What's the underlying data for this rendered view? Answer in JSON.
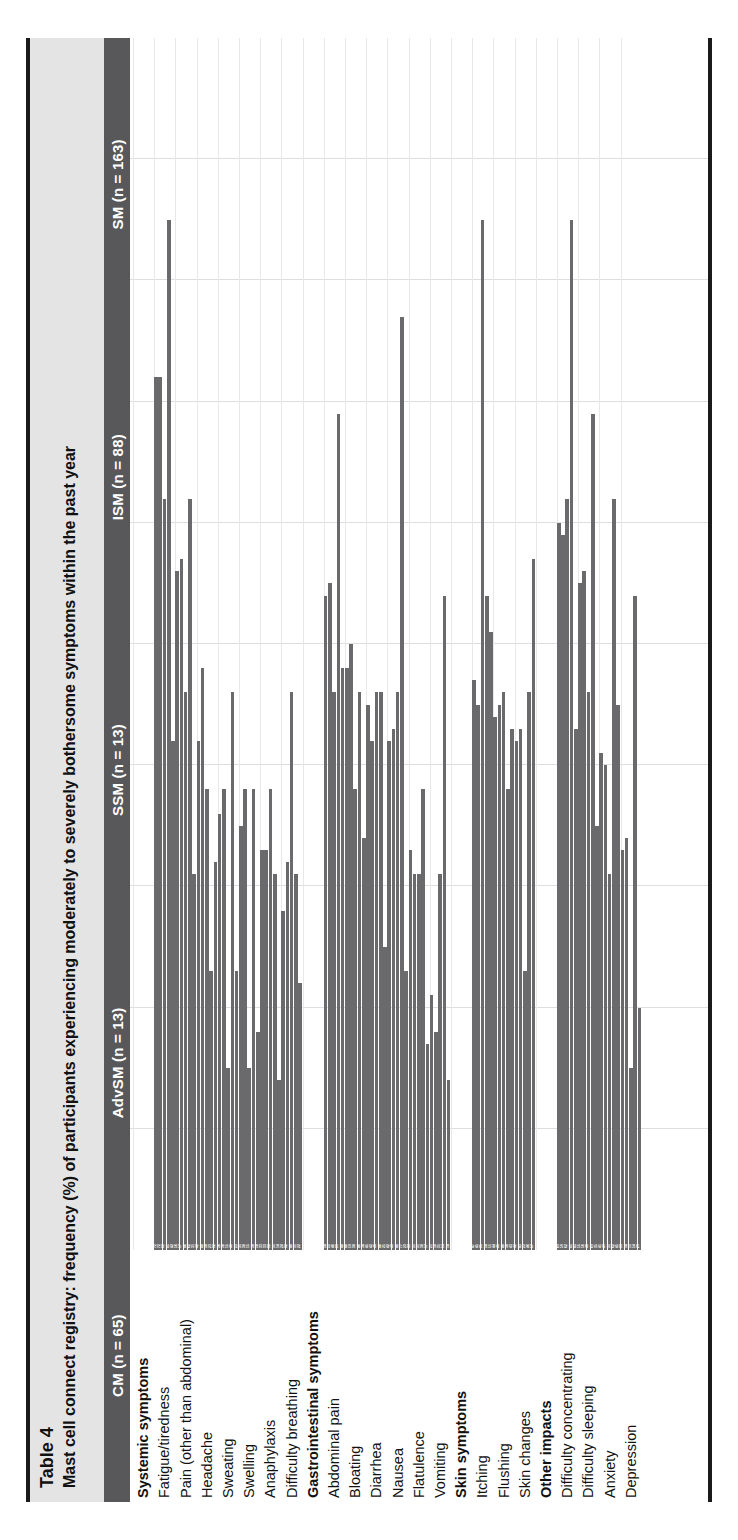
{
  "caption": {
    "table_number": "Table 4",
    "description": "Mast cell connect registry: frequency (%) of participants experiencing moderately to severely bothersome symptoms within the past year"
  },
  "colors": {
    "header_band": "#58585a",
    "bar": "#6a6a6c",
    "caption_background": "#e4e4e4",
    "rule": "#1a1a1a",
    "gridline": "#dedede",
    "value_label": "#ffffff"
  },
  "chart_data": {
    "type": "bar",
    "title": "Mast cell connect registry: frequency (%) of participants experiencing moderately to severely bothersome symptoms within the past year",
    "xlabel": "",
    "ylabel": "Frequency (%)",
    "xlim": [
      0,
      100
    ],
    "grid": true,
    "legend_position": "top-header-band",
    "orientation": "horizontal",
    "series": [
      {
        "name": "SM (n = 163)",
        "values": [
          72,
          56,
          42,
          36,
          35,
          33,
          28,
          54,
          48,
          45,
          42,
          33,
          21,
          47,
          44,
          42,
          60,
          55,
          41,
          33
        ]
      },
      {
        "name": "ISM (n = 88)",
        "values": [
          72,
          57,
          48,
          38,
          38,
          33,
          32,
          55,
          50,
          42,
          43,
          31,
          18,
          45,
          45,
          43,
          59,
          56,
          40,
          34
        ]
      },
      {
        "name": "SSM (n = 13)",
        "values": [
          62,
          46,
          38,
          15,
          15,
          38,
          46,
          46,
          38,
          46,
          46,
          31,
          31,
          85,
          46,
          23,
          62,
          46,
          31,
          15
        ]
      },
      {
        "name": "AdvSM (n = 13)",
        "values": [
          85,
          62,
          23,
          46,
          38,
          31,
          31,
          69,
          46,
          46,
          77,
          38,
          54,
          54,
          38,
          46,
          85,
          69,
          62,
          54
        ]
      },
      {
        "name": "CM (n = 65)",
        "values": [
          42,
          31,
          32,
          23,
          18,
          14,
          22,
          48,
          34,
          25,
          23,
          17,
          14,
          51,
          43,
          57,
          43,
          35,
          45,
          20
        ]
      }
    ],
    "categories": [
      "Fatigue/tiredness",
      "Pain (other than abdominal)",
      "Headache",
      "Sweating",
      "Swelling",
      "Anaphylaxis",
      "Difficulty breathing",
      "Abdominal pain",
      "Bloating",
      "Diarrhea",
      "Nausea",
      "Flatulence",
      "Vomiting",
      "Itching",
      "Flushing",
      "Skin changes",
      "Difficulty concentrating",
      "Difficulty sleeping",
      "Anxiety",
      "Depression"
    ],
    "groups": [
      {
        "label": "Systemic symptoms",
        "rows": [
          0,
          1,
          2,
          3,
          4,
          5,
          6
        ]
      },
      {
        "label": "Gastrointestinal symptoms",
        "rows": [
          7,
          8,
          9,
          10,
          11,
          12
        ]
      },
      {
        "label": "Skin symptoms",
        "rows": [
          13,
          14,
          15
        ]
      },
      {
        "label": "Other impacts",
        "rows": [
          16,
          17,
          18,
          19
        ]
      }
    ]
  }
}
